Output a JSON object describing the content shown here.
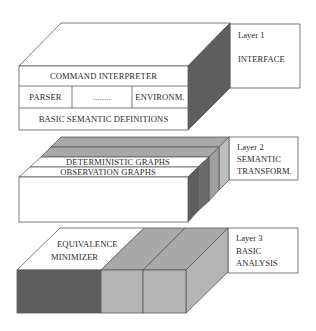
{
  "diagram": {
    "type": "layered-architecture-3d",
    "colors": {
      "white": "#ffffff",
      "dark": "#5e5e5e",
      "mid": "#a8a8a8",
      "light": "#bdbdbd",
      "stroke": "#5a5a5a"
    },
    "layers": [
      {
        "id": "layer1",
        "caption": "Layer 1",
        "name": "INTERFACE",
        "front_rows": [
          {
            "label": "COMMAND INTERPRETER"
          },
          {
            "cells": [
              "PARSER",
              "........",
              "ENVIRONM."
            ]
          },
          {
            "label": "BASIC  SEMANTIC  DEFINITIONS"
          }
        ]
      },
      {
        "id": "layer2",
        "caption": "Layer  2",
        "name_line1": "SEMANTIC",
        "name_line2": "TRANSFORM.",
        "slabs": [
          "DETERMINISTIC  GRAPHS",
          "OBSERVATION  GRAPHS"
        ]
      },
      {
        "id": "layer3",
        "caption": "Layer  3",
        "name_line1": "BASIC",
        "name_line2": "ANALYSIS",
        "top_label_line1": "EQUIVALENCE",
        "top_label_line2": "MINIMIZER"
      }
    ]
  }
}
